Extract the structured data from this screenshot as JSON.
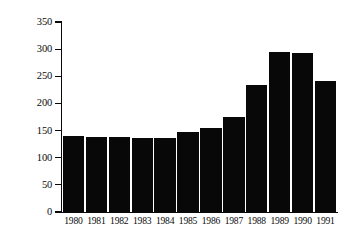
{
  "chart_data": {
    "type": "bar",
    "title": "",
    "subtitle": "",
    "xlabel": "",
    "ylabel": "£Million",
    "categories": [
      "1980",
      "1981",
      "1982",
      "1983",
      "1984",
      "1985",
      "1986",
      "1987",
      "1988",
      "1989",
      "1990",
      "1991"
    ],
    "values": [
      140,
      138,
      138,
      137,
      136,
      148,
      155,
      175,
      234,
      294,
      293,
      241
    ],
    "series": [
      {
        "name": "£Million",
        "values": [
          140,
          138,
          138,
          137,
          136,
          148,
          155,
          175,
          234,
          294,
          293,
          241
        ]
      }
    ],
    "ylim": [
      0,
      350
    ],
    "yticks": [
      0,
      50,
      100,
      150,
      200,
      250,
      300,
      350
    ],
    "ytick_labels": [
      "0",
      "50",
      "100",
      "150",
      "200",
      "250",
      "300",
      "350"
    ],
    "grid": false,
    "legend": null,
    "legend_position": "none",
    "bar_color": "#080808",
    "axis_color": "#0a0a0a",
    "background_color": "#ffffff",
    "annotations": []
  },
  "axes": {
    "y_title": "£Million"
  }
}
